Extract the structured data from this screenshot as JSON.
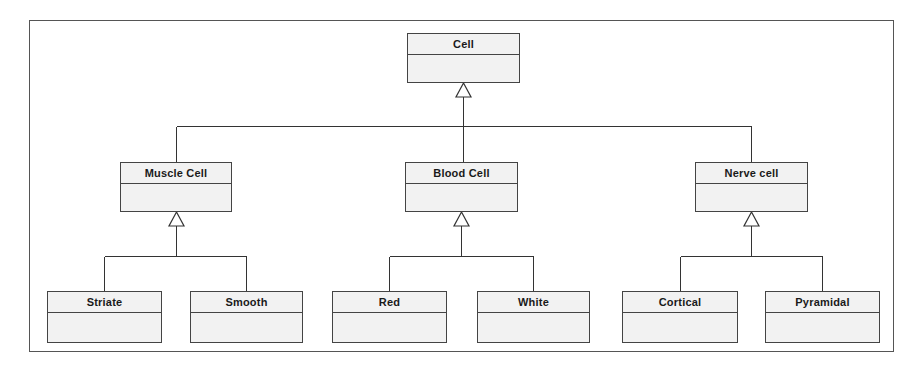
{
  "diagram": {
    "type": "uml-class-diagram",
    "title": "",
    "frame": {
      "x": 29,
      "y": 20,
      "width": 865,
      "height": 332
    },
    "relationship_kind": "generalization",
    "arrowhead": "hollow-triangle",
    "colors": {
      "box_fill": "#f2f2f2",
      "box_border": "#444444",
      "frame_border": "#555555",
      "line": "#333333",
      "text": "#1a1a1a",
      "background": "#ffffff"
    },
    "classes": [
      {
        "id": "cell",
        "name": "Cell",
        "level": 0,
        "x": 407,
        "y": 33,
        "width": 113,
        "height": 50,
        "attributes": [],
        "operations": []
      },
      {
        "id": "muscle-cell",
        "name": "Muscle Cell",
        "level": 1,
        "parent": "cell",
        "x": 120,
        "y": 162,
        "width": 112,
        "height": 50,
        "attributes": [],
        "operations": []
      },
      {
        "id": "blood-cell",
        "name": "Blood Cell",
        "level": 1,
        "parent": "cell",
        "x": 405,
        "y": 162,
        "width": 113,
        "height": 50,
        "attributes": [],
        "operations": []
      },
      {
        "id": "nerve-cell",
        "name": "Nerve cell",
        "level": 1,
        "parent": "cell",
        "x": 695,
        "y": 162,
        "width": 113,
        "height": 50,
        "attributes": [],
        "operations": []
      },
      {
        "id": "striate",
        "name": "Striate",
        "level": 2,
        "parent": "muscle-cell",
        "x": 47,
        "y": 291,
        "width": 115,
        "height": 52,
        "attributes": [],
        "operations": []
      },
      {
        "id": "smooth",
        "name": "Smooth",
        "level": 2,
        "parent": "muscle-cell",
        "x": 190,
        "y": 291,
        "width": 113,
        "height": 52,
        "attributes": [],
        "operations": []
      },
      {
        "id": "red",
        "name": "Red",
        "level": 2,
        "parent": "blood-cell",
        "x": 332,
        "y": 291,
        "width": 115,
        "height": 52,
        "attributes": [],
        "operations": []
      },
      {
        "id": "white",
        "name": "White",
        "level": 2,
        "parent": "blood-cell",
        "x": 477,
        "y": 291,
        "width": 113,
        "height": 52,
        "attributes": [],
        "operations": []
      },
      {
        "id": "cortical",
        "name": "Cortical",
        "level": 2,
        "parent": "nerve-cell",
        "x": 622,
        "y": 291,
        "width": 116,
        "height": 52,
        "attributes": [],
        "operations": []
      },
      {
        "id": "pyramidal",
        "name": "Pyramidal",
        "level": 2,
        "parent": "nerve-cell",
        "x": 765,
        "y": 291,
        "width": 115,
        "height": 52,
        "attributes": [],
        "operations": []
      }
    ],
    "generalizations": [
      {
        "from": "muscle-cell",
        "to": "cell"
      },
      {
        "from": "blood-cell",
        "to": "cell"
      },
      {
        "from": "nerve-cell",
        "to": "cell"
      },
      {
        "from": "striate",
        "to": "muscle-cell"
      },
      {
        "from": "smooth",
        "to": "muscle-cell"
      },
      {
        "from": "red",
        "to": "blood-cell"
      },
      {
        "from": "white",
        "to": "blood-cell"
      },
      {
        "from": "cortical",
        "to": "nerve-cell"
      },
      {
        "from": "pyramidal",
        "to": "nerve-cell"
      }
    ]
  }
}
